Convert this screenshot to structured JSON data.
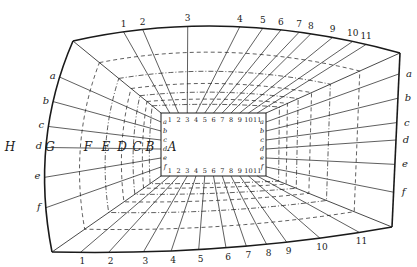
{
  "diagram": {
    "outer_top_numbers": [
      "1",
      "2",
      "3",
      "4",
      "5",
      "6",
      "7",
      "8",
      "9",
      "10",
      "11"
    ],
    "outer_bottom_numbers": [
      "1",
      "2",
      "3",
      "4",
      "5",
      "6",
      "7",
      "8",
      "9",
      "10",
      "11"
    ],
    "outer_left_letters": [
      "a",
      "b",
      "c",
      "d",
      "e",
      "f"
    ],
    "outer_right_letters": [
      "a",
      "b",
      "c",
      "d",
      "e",
      "f"
    ],
    "inner_top_numbers": [
      "1",
      "2",
      "3",
      "4",
      "5",
      "6",
      "7",
      "8",
      "9",
      "10",
      "11"
    ],
    "inner_bottom_numbers": [
      "1",
      "2",
      "3",
      "4",
      "5",
      "6",
      "7",
      "8",
      "9",
      "10",
      "11"
    ],
    "inner_left_letters": [
      "a",
      "b",
      "c",
      "d",
      "e",
      "f"
    ],
    "inner_right_letters": [
      "a",
      "b",
      "c",
      "d",
      "e",
      "f"
    ],
    "depth_letters": [
      "H",
      "G",
      "F",
      "E",
      "D",
      "C",
      "B",
      "A"
    ],
    "colors": {
      "line": "#1a1a1a",
      "background": "#ffffff"
    }
  }
}
